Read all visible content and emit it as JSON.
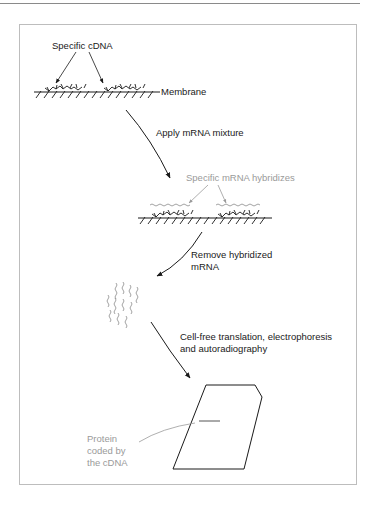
{
  "figure": {
    "type": "flow-diagram",
    "steps": [
      {
        "id": "membrane",
        "label": "Membrane",
        "callout": "Specific cDNA"
      },
      {
        "id": "apply",
        "label": "Apply mRNA mixture"
      },
      {
        "id": "hybridize",
        "callout": "Specific mRNA hybridizes"
      },
      {
        "id": "remove",
        "label": "Remove hybridized mRNA"
      },
      {
        "id": "translate",
        "label": "Cell-free translation, electrophoresis and autoradiography"
      },
      {
        "id": "gel",
        "callout": "Protein coded by the cDNA"
      }
    ],
    "labels": {
      "specific_cdna": "Specific cDNA",
      "membrane": "Membrane",
      "apply_mrna": "Apply mRNA mixture",
      "specific_mrna": "Specific mRNA hybridizes",
      "remove_line1": "Remove hybridized",
      "remove_line2": "mRNA",
      "translation_line1": "Cell-free translation, electrophoresis",
      "translation_line2": "and autoradiography",
      "protein_line1": "Protein",
      "protein_line2": "coded by",
      "protein_line3": "the cDNA"
    },
    "colors": {
      "ink": "#1a1a1a",
      "callout_grey": "#9a9a9a",
      "frame": "#bdbdbd"
    }
  }
}
